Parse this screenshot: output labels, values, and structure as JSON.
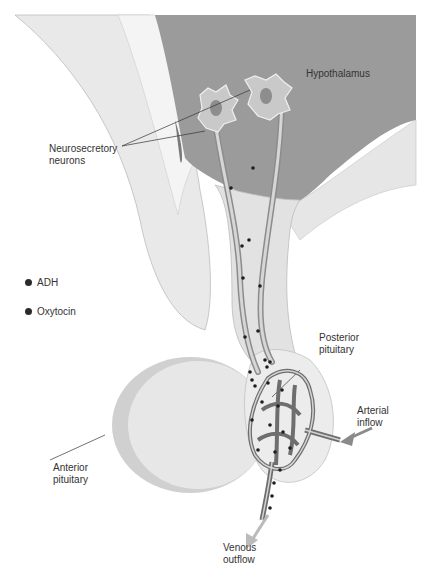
{
  "figure": {
    "type": "anatomical-diagram"
  },
  "labels": {
    "hypothalamus": "Hypothalamus",
    "neurosecretory_neurons": "Neurosecretory\nneurons",
    "posterior_pituitary": "Posterior\npituitary",
    "arterial_inflow": "Arterial\ninflow",
    "anterior_pituitary": "Anterior\npituitary",
    "venous_outflow": "Venous\noutflow"
  },
  "legend": {
    "items": [
      {
        "label": "ADH",
        "color": "#2b2b2b"
      },
      {
        "label": "Oxytocin",
        "color": "#2b2b2b"
      }
    ]
  },
  "colors": {
    "hypothalamus_fill": "#9a9a9a",
    "tissue_light": "#e4e4e4",
    "tissue_mid": "#cfcfcf",
    "vessel": "#7d7d7d",
    "granule": "#1e1e1e",
    "arrow": "#8a8a8a"
  }
}
